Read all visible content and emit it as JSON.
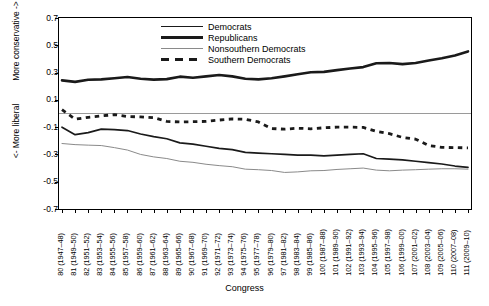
{
  "chart_data": {
    "type": "line",
    "title": "",
    "xlabel": "Congress",
    "ylabel_top": "More conservative ->",
    "ylabel_bottom": "<- More liberal",
    "ylim": [
      -0.7,
      0.7
    ],
    "ytick_values": [
      0.7,
      0.5,
      0.3,
      0.1,
      -0.1,
      -0.3,
      -0.5,
      -0.7
    ],
    "ytick_labels": [
      "0.7",
      "0.5",
      "0.3",
      "0.1",
      "-0.1",
      "-0.3",
      "-0.5",
      "-0.7"
    ],
    "grid": false,
    "zero_line": true,
    "legend_position": "top-center",
    "categories": [
      "80 (1947–48)",
      "81 (1949–50)",
      "82 (1951–52)",
      "83 (1953–54)",
      "84 (1955–56)",
      "85 (1957–58)",
      "86 (1959–60)",
      "87 (1961–62)",
      "88 (1963–64)",
      "89 (1965–66)",
      "90 (1967–68)",
      "91 (1969–70)",
      "92 (1971–72)",
      "93 (1973–74)",
      "94 (1975–76)",
      "95 (1977–78)",
      "96 (1979–80)",
      "97 (1981–82)",
      "98 (1983–84)",
      "99 (1985–86)",
      "100 (1987–88)",
      "101 (1989–90)",
      "102 (1991–92)",
      "103 (1993–94)",
      "104 (1995–96)",
      "105 (1997–98)",
      "106 (1999–00)",
      "107 (2001–02)",
      "108 (2003–04)",
      "109 (2005–06)",
      "110 (2007–08)",
      "111 (2009–10)"
    ],
    "series": [
      {
        "name": "Democrats",
        "style": "solid",
        "color": "#1a1a1a",
        "width": 1.7,
        "values": [
          -0.1,
          -0.155,
          -0.14,
          -0.115,
          -0.118,
          -0.125,
          -0.15,
          -0.17,
          -0.185,
          -0.215,
          -0.225,
          -0.24,
          -0.255,
          -0.265,
          -0.285,
          -0.29,
          -0.295,
          -0.3,
          -0.305,
          -0.305,
          -0.31,
          -0.305,
          -0.3,
          -0.295,
          -0.33,
          -0.335,
          -0.34,
          -0.35,
          -0.36,
          -0.37,
          -0.385,
          -0.395
        ]
      },
      {
        "name": "Republicans",
        "style": "solid",
        "color": "#1a1a1a",
        "width": 2.6,
        "values": [
          0.243,
          0.232,
          0.247,
          0.25,
          0.258,
          0.268,
          0.255,
          0.248,
          0.252,
          0.27,
          0.262,
          0.272,
          0.282,
          0.272,
          0.255,
          0.25,
          0.258,
          0.272,
          0.288,
          0.302,
          0.305,
          0.318,
          0.33,
          0.34,
          0.368,
          0.37,
          0.362,
          0.37,
          0.388,
          0.405,
          0.425,
          0.455
        ]
      },
      {
        "name": "Nonsouthern Democrats",
        "style": "solid",
        "color": "#8a8a8a",
        "width": 1.0,
        "values": [
          -0.22,
          -0.228,
          -0.232,
          -0.235,
          -0.25,
          -0.268,
          -0.3,
          -0.318,
          -0.33,
          -0.35,
          -0.358,
          -0.372,
          -0.382,
          -0.39,
          -0.408,
          -0.412,
          -0.418,
          -0.432,
          -0.428,
          -0.42,
          -0.418,
          -0.41,
          -0.405,
          -0.4,
          -0.415,
          -0.42,
          -0.415,
          -0.412,
          -0.408,
          -0.405,
          -0.405,
          -0.408
        ]
      },
      {
        "name": "Southern Democrats",
        "style": "dashed",
        "color": "#1a1a1a",
        "width": 2.8,
        "values": [
          0.028,
          -0.042,
          -0.028,
          -0.018,
          -0.008,
          -0.022,
          -0.025,
          -0.03,
          -0.058,
          -0.062,
          -0.06,
          -0.058,
          -0.048,
          -0.04,
          -0.042,
          -0.062,
          -0.11,
          -0.115,
          -0.108,
          -0.112,
          -0.105,
          -0.1,
          -0.1,
          -0.102,
          -0.13,
          -0.148,
          -0.175,
          -0.188,
          -0.235,
          -0.248,
          -0.25,
          -0.252
        ]
      }
    ]
  },
  "legend": {
    "items": [
      {
        "label": "Democrats"
      },
      {
        "label": "Republicans"
      },
      {
        "label": "Nonsouthern Democrats"
      },
      {
        "label": "Southern Democrats"
      }
    ]
  }
}
